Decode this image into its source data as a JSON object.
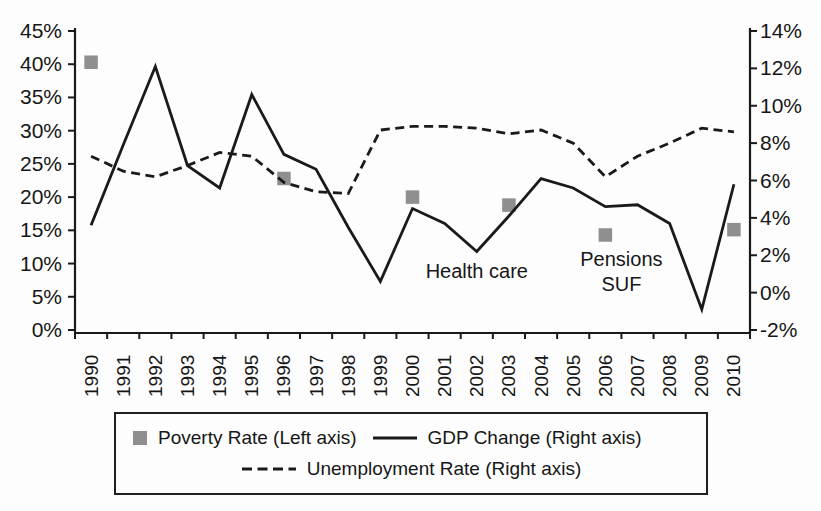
{
  "figure": {
    "ink_color": "#1a1a1a",
    "marker_color": "#8f8f8f",
    "background": "#fdfdfd"
  },
  "chart_data": {
    "type": "line",
    "title": "",
    "x_categories": [
      "1990",
      "1991",
      "1992",
      "1993",
      "1994",
      "1995",
      "1996",
      "1997",
      "1998",
      "1999",
      "2000",
      "2001",
      "2002",
      "2003",
      "2004",
      "2005",
      "2006",
      "2007",
      "2008",
      "2009",
      "2010"
    ],
    "left_axis": {
      "min": 0,
      "max": 45,
      "step": 5,
      "tick_labels": [
        "0%",
        "5%",
        "10%",
        "15%",
        "20%",
        "25%",
        "30%",
        "35%",
        "40%",
        "45%"
      ]
    },
    "right_axis": {
      "min": -2,
      "max": 14,
      "step": 2,
      "tick_labels": [
        "-2%",
        "0%",
        "2%",
        "4%",
        "6%",
        "8%",
        "10%",
        "12%",
        "14%"
      ]
    },
    "grid": false,
    "legend_position": "bottom",
    "series": [
      {
        "key": "poverty-rate",
        "name": "Poverty Rate (Left axis)",
        "axis": "left",
        "type": "scatter",
        "marker": "square",
        "color": "#8f8f8f",
        "points": [
          {
            "year": "1990",
            "value": 40.3
          },
          {
            "year": "1996",
            "value": 22.8
          },
          {
            "year": "2000",
            "value": 20.0
          },
          {
            "year": "2003",
            "value": 18.8
          },
          {
            "year": "2006",
            "value": 14.3
          },
          {
            "year": "2010",
            "value": 15.1
          }
        ]
      },
      {
        "key": "gdp-change",
        "name": "GDP Change (Right axis)",
        "axis": "right",
        "type": "line",
        "line_style": "solid",
        "color": "#1a1a1a",
        "values": [
          3.6,
          7.9,
          12.1,
          6.8,
          5.6,
          10.6,
          7.4,
          6.6,
          3.5,
          0.6,
          4.5,
          3.7,
          2.2,
          4.1,
          6.1,
          5.6,
          4.6,
          4.7,
          3.7,
          -0.9,
          5.8
        ]
      },
      {
        "key": "unemployment-rate",
        "name": "Unemployment Rate (Right axis)",
        "axis": "right",
        "type": "line",
        "line_style": "dashed",
        "color": "#1a1a1a",
        "values": [
          7.3,
          6.5,
          6.2,
          6.8,
          7.5,
          7.3,
          5.9,
          5.4,
          5.3,
          8.7,
          8.9,
          8.9,
          8.8,
          8.5,
          8.7,
          8.0,
          6.2,
          7.3,
          8.0,
          8.8,
          8.6
        ]
      }
    ],
    "annotations": [
      {
        "key": "health-care",
        "lines": [
          "Health care"
        ],
        "x_year": 2002,
        "y_right": 0.8
      },
      {
        "key": "pensions-suf",
        "lines": [
          "Pensions",
          "SUF"
        ],
        "x_year": 2006.5,
        "y_right": 1.4
      }
    ]
  },
  "legend": {
    "items": [
      {
        "label": "Poverty Rate (Left axis)",
        "swatch": "gray-square"
      },
      {
        "label": "GDP Change (Right axis)",
        "swatch": "solid-line"
      },
      {
        "label": "Unemployment Rate (Right axis)",
        "swatch": "dashed-line"
      }
    ]
  }
}
